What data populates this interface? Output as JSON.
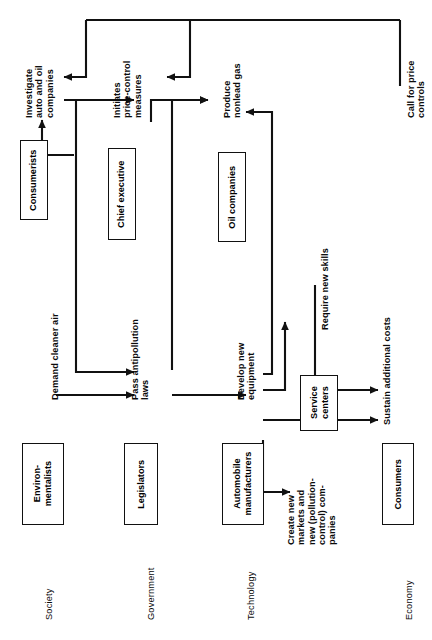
{
  "diagram": {
    "orientation": "rotated-90-ccw",
    "stroke_color": "#111111",
    "background_color": "#ffffff"
  },
  "columns": [
    {
      "id": "society",
      "label": "Society"
    },
    {
      "id": "government",
      "label": "Government"
    },
    {
      "id": "technology",
      "label": "Technology"
    },
    {
      "id": "economy",
      "label": "Economy"
    }
  ],
  "actors": [
    {
      "id": "environmentalists",
      "label": "Environ-\nmentalists",
      "column": "society"
    },
    {
      "id": "consumerists",
      "label": "Consumerists",
      "column": "society"
    },
    {
      "id": "legislators",
      "label": "Legislators",
      "column": "government"
    },
    {
      "id": "chief-executive",
      "label": "Chief executive",
      "column": "government"
    },
    {
      "id": "auto-manufacturers",
      "label": "Automobile\nmanufacturers",
      "column": "technology"
    },
    {
      "id": "oil-companies",
      "label": "Oil companies",
      "column": "technology"
    },
    {
      "id": "service-centers",
      "label": "Service\ncenters",
      "column": "technology"
    },
    {
      "id": "consumers",
      "label": "Consumers",
      "column": "economy"
    }
  ],
  "actions": [
    {
      "id": "demand-cleaner-air",
      "label": "Demand cleaner air"
    },
    {
      "id": "investigate-companies",
      "label": "Investigate\nauto and oil\ncompanies"
    },
    {
      "id": "pass-antipollution-laws",
      "label": "Pass antipollution\nlaws"
    },
    {
      "id": "initiates-price-control",
      "label": "Initiates\nprice-control\nmeasures"
    },
    {
      "id": "develop-new-equipment",
      "label": "Develop new\nequipment"
    },
    {
      "id": "create-new-markets",
      "label": "Create new\nmarkets and\nnew (pollution-\ncontrol) com-\npanies"
    },
    {
      "id": "produce-nonlead-gas",
      "label": "Produce\nnonlead gas"
    },
    {
      "id": "require-new-skills",
      "label": "Require new skills"
    },
    {
      "id": "sustain-additional-costs",
      "label": "Sustain additional costs"
    },
    {
      "id": "call-for-price-controls",
      "label": "Call for price\ncontrols"
    }
  ],
  "flows": [
    {
      "from": "environmentalists",
      "to": "demand-cleaner-air"
    },
    {
      "from": "demand-cleaner-air",
      "to": "pass-antipollution-laws"
    },
    {
      "from": "consumerists",
      "to": "investigate-companies"
    },
    {
      "from": "investigate-companies",
      "to": "initiates-price-control"
    },
    {
      "from": "pass-antipollution-laws",
      "to": "develop-new-equipment"
    },
    {
      "from": "pass-antipollution-laws",
      "to": "produce-nonlead-gas"
    },
    {
      "from": "develop-new-equipment",
      "to": "create-new-markets"
    },
    {
      "from": "develop-new-equipment",
      "to": "require-new-skills"
    },
    {
      "from": "develop-new-equipment",
      "to": "produce-nonlead-gas"
    },
    {
      "from": "develop-new-equipment",
      "to": "sustain-additional-costs"
    },
    {
      "from": "require-new-skills",
      "to": "sustain-additional-costs"
    },
    {
      "from": "call-for-price-controls",
      "to": "initiates-price-control"
    },
    {
      "from": "call-for-price-controls",
      "to": "investigate-companies"
    },
    {
      "from": "sustain-additional-costs",
      "to": "call-for-price-controls"
    },
    {
      "from": "initiates-price-control",
      "to": "produce-nonlead-gas"
    }
  ]
}
